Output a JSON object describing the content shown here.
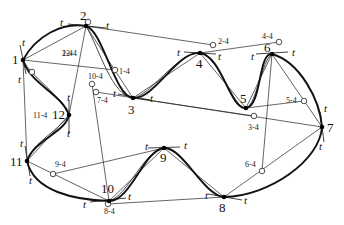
{
  "diagram": {
    "colors": {
      "stroke": "#111111",
      "background": "#ffffff"
    },
    "nodes": [
      {
        "id": "1",
        "label": "1",
        "x": 23,
        "y": 60
      },
      {
        "id": "2",
        "label": "2",
        "x": 86,
        "y": 26
      },
      {
        "id": "3",
        "label": "3",
        "x": 133,
        "y": 98
      },
      {
        "id": "4",
        "label": "4",
        "x": 200,
        "y": 53
      },
      {
        "id": "5",
        "label": "5",
        "x": 246,
        "y": 108
      },
      {
        "id": "6",
        "label": "6",
        "x": 272,
        "y": 54
      },
      {
        "id": "7",
        "label": "7",
        "x": 322,
        "y": 127
      },
      {
        "id": "8",
        "label": "8",
        "x": 224,
        "y": 197
      },
      {
        "id": "9",
        "label": "9",
        "x": 164,
        "y": 148
      },
      {
        "id": "10",
        "label": "10",
        "x": 109,
        "y": 201
      },
      {
        "id": "11",
        "label": "11",
        "x": 27,
        "y": 161
      },
      {
        "id": "12",
        "label": "12",
        "x": 69,
        "y": 115
      }
    ],
    "aux_points": [
      {
        "label": "2-4",
        "x": 213,
        "y": 45
      },
      {
        "label": "4-4",
        "x": 279,
        "y": 42
      },
      {
        "label": "5-4",
        "x": 304,
        "y": 101
      },
      {
        "label": "3-4",
        "x": 254,
        "y": 116
      },
      {
        "label": "6-4",
        "x": 262,
        "y": 171
      },
      {
        "label": "1-4",
        "x": 115,
        "y": 70
      },
      {
        "label": "10-4",
        "x": 92,
        "y": 84
      },
      {
        "label": "7-4",
        "x": 96,
        "y": 92
      },
      {
        "label": "9-4",
        "x": 53,
        "y": 174
      },
      {
        "label": "8-4",
        "x": 108,
        "y": 204
      },
      {
        "label": "12-4",
        "x": 88,
        "y": 22
      },
      {
        "label": "11-4",
        "x": 32,
        "y": 72
      }
    ],
    "tangent_label": "t"
  }
}
